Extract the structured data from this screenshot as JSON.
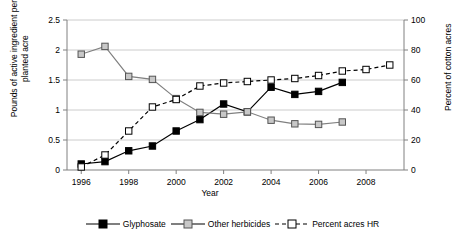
{
  "chart_data": {
    "type": "line",
    "title": "",
    "xlabel": "Year",
    "ylabel": "Pounds of active ingredient per planted acre",
    "ylabel_right": "Percent of cotton acres",
    "xlim": [
      1995.4,
      2009.6
    ],
    "ylim": [
      0,
      2.5
    ],
    "ylim_right": [
      0,
      100
    ],
    "xticks": [
      "1996",
      "1998",
      "2000",
      "2002",
      "2004",
      "2006",
      "2008"
    ],
    "xtick_values": [
      1996,
      1998,
      2000,
      2002,
      2004,
      2006,
      2008
    ],
    "yticks": [
      "0",
      "0.5",
      "1",
      "1.5",
      "2",
      "2.5"
    ],
    "ytick_values": [
      0,
      0.5,
      1,
      1.5,
      2,
      2.5
    ],
    "yticks_right": [
      "0",
      "20",
      "40",
      "60",
      "80",
      "100"
    ],
    "ytick_right_values": [
      0,
      20,
      40,
      60,
      80,
      100
    ],
    "grid": true,
    "legend_position": "bottom",
    "series": [
      {
        "name": "Glyphosate",
        "axis": "left",
        "marker": "filled-square",
        "line": "solid",
        "color": "#000000",
        "x": [
          1996,
          1997,
          1998,
          1999,
          2000,
          2001,
          2002,
          2003,
          2004,
          2005,
          2006,
          2007
        ],
        "values": [
          0.1,
          0.14,
          0.32,
          0.4,
          0.65,
          0.84,
          1.1,
          0.97,
          1.38,
          1.26,
          1.31,
          1.46
        ]
      },
      {
        "name": "Other herbicides",
        "axis": "left",
        "marker": "open-square",
        "line": "solid",
        "color": "#808080",
        "x": [
          1996,
          1997,
          1998,
          1999,
          2000,
          2001,
          2002,
          2003,
          2004,
          2005,
          2006,
          2007
        ],
        "values": [
          1.93,
          2.06,
          1.56,
          1.51,
          1.19,
          0.96,
          0.93,
          0.97,
          0.83,
          0.77,
          0.76,
          0.8
        ]
      },
      {
        "name": "Percent acres HR",
        "axis": "right",
        "marker": "open-square",
        "line": "dashed",
        "color": "#000000",
        "x": [
          1996,
          1997,
          1998,
          1999,
          2000,
          2001,
          2002,
          2003,
          2004,
          2005,
          2006,
          2007,
          2008,
          2009
        ],
        "values": [
          2,
          10,
          26,
          42,
          47,
          56,
          58,
          59,
          60,
          61,
          63,
          66,
          67,
          70
        ]
      }
    ]
  },
  "legend": {
    "items": [
      {
        "label": "Glyphosate"
      },
      {
        "label": "Other herbicides"
      },
      {
        "label": "Percent acres HR"
      }
    ]
  }
}
